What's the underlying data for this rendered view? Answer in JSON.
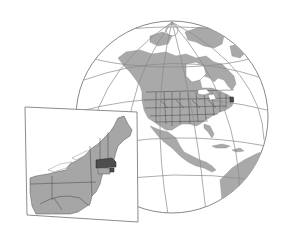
{
  "figure": {
    "title": "Location map of Massachusetts"
  },
  "globe": {
    "region": "North America",
    "center_px": [
      172,
      117
    ],
    "radius_px": 96,
    "highlight_marker": "Massachusetts",
    "colors": {
      "land": "#a9a9a9",
      "ocean": "#ffffff",
      "graticule": "#8a8a8a",
      "borders": "#3a3a3a",
      "highlight": "#4d4d4d"
    }
  },
  "inset": {
    "region": "Northeastern United States",
    "highlighted_state": "Massachusetts",
    "states_shown": [
      "Maine",
      "New Hampshire",
      "Vermont",
      "Massachusetts",
      "Rhode Island",
      "Connecticut",
      "New York",
      "New Jersey",
      "Pennsylvania",
      "Delaware",
      "Maryland",
      "Ohio",
      "West Virginia",
      "Virginia"
    ],
    "colors": {
      "land": "#a6a6a6",
      "highlight": "#4d4d4d",
      "frame": "#6e6e6e"
    }
  }
}
